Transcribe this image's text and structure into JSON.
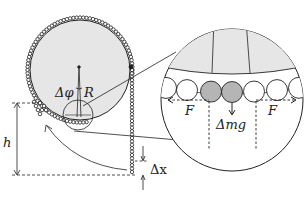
{
  "diagram": {
    "type": "physics-schematic",
    "colors": {
      "wheel_fill": "#e6e6e6",
      "line": "#222222",
      "highlight_links": "#b5b5b5",
      "background": "#ffffff"
    },
    "labels": {
      "angle": "Δφ",
      "radius": "R",
      "height": "h",
      "displacement": "Δx",
      "force_left": "F",
      "force_right": "F",
      "weight": "Δmg"
    }
  }
}
